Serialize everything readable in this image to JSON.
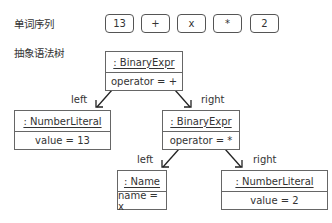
{
  "labels": {
    "token_sequence": "单词序列",
    "ast": "抽象语法树"
  },
  "tokens": [
    "13",
    "+",
    "x",
    "*",
    "2"
  ],
  "tree": {
    "root": {
      "type": ": BinaryExpr",
      "attr": "operator = +"
    },
    "root_left": {
      "edge": "left",
      "type": ": NumberLiteral",
      "attr": "value = 13"
    },
    "root_right": {
      "edge": "right",
      "type": ": BinaryExpr",
      "attr": "operator = *"
    },
    "inner_left": {
      "edge": "left",
      "type": ": Name",
      "attr": "name = x"
    },
    "inner_right": {
      "edge": "right",
      "type": ": NumberLiteral",
      "attr": "value = 2"
    }
  }
}
